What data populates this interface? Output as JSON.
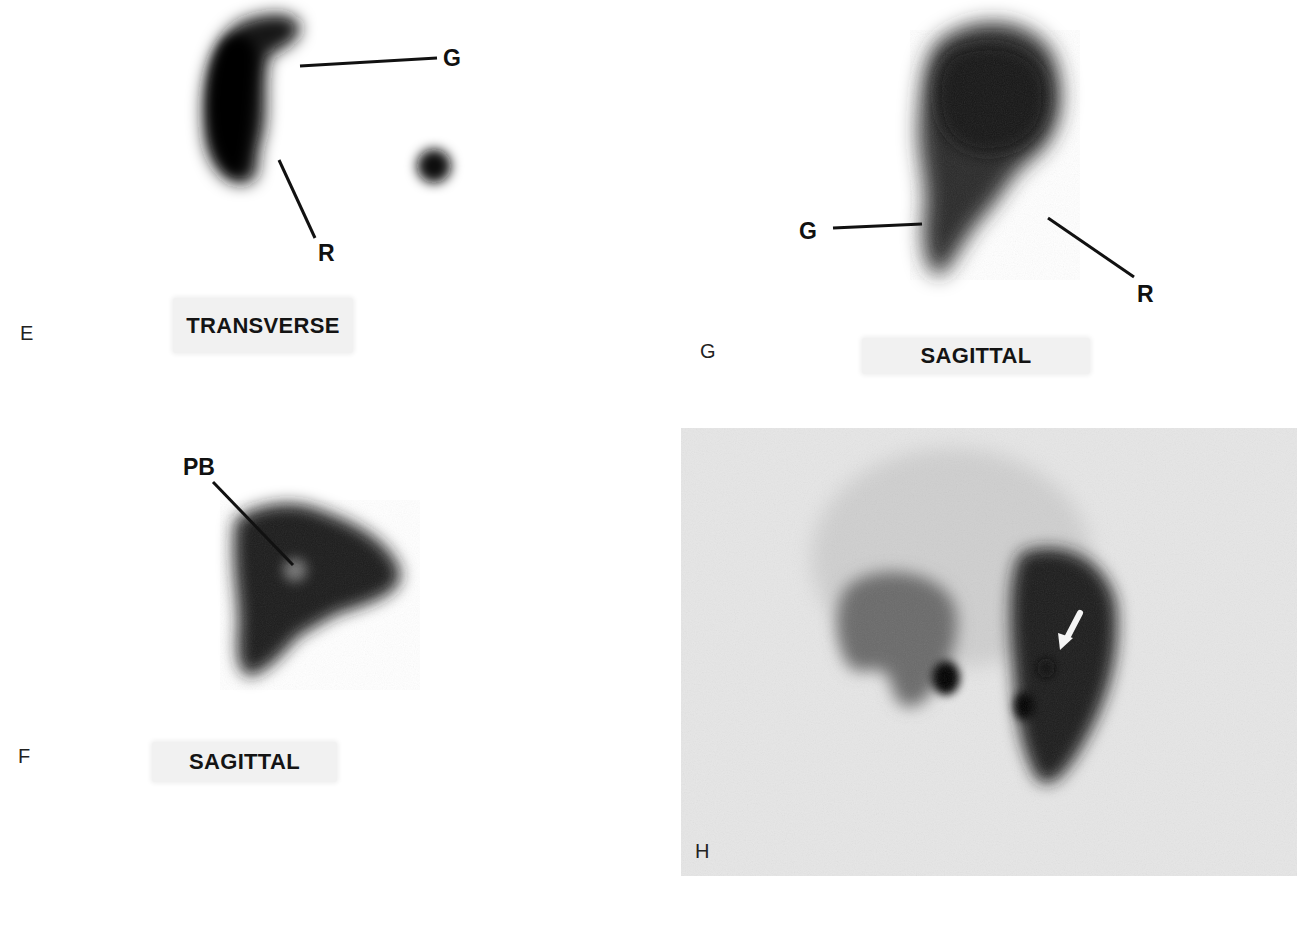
{
  "figure": {
    "panels": [
      {
        "id": "E",
        "letter": "E",
        "caption": "TRANSVERSE",
        "annotations": [
          "G",
          "R"
        ]
      },
      {
        "id": "F",
        "letter": "F",
        "caption": "SAGITTAL",
        "annotations": [
          "PB"
        ]
      },
      {
        "id": "G",
        "letter": "G",
        "caption": "SAGITTAL",
        "annotations": [
          "G",
          "R"
        ]
      },
      {
        "id": "H",
        "letter": "H",
        "caption": "",
        "annotations": [],
        "arrow": "white arrow pointing down-left"
      }
    ]
  },
  "colors": {
    "background": "#ffffff",
    "uptake": "#111111",
    "panel_h_background": "#e6e6e6",
    "caption_box": "#f1f1f1"
  }
}
